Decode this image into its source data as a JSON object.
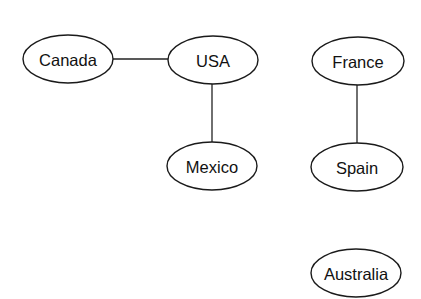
{
  "diagram": {
    "type": "undirected-graph",
    "style": {
      "stroke_color": "#1a1a1a",
      "text_color": "#111111",
      "background": "#ffffff"
    },
    "nodes": [
      {
        "id": "canada",
        "label": "Canada",
        "cx": 68,
        "cy": 59,
        "rx": 45,
        "ry": 24
      },
      {
        "id": "usa",
        "label": "USA",
        "cx": 213,
        "cy": 60,
        "rx": 45,
        "ry": 24
      },
      {
        "id": "france",
        "label": "France",
        "cx": 358,
        "cy": 61,
        "rx": 46,
        "ry": 24
      },
      {
        "id": "mexico",
        "label": "Mexico",
        "cx": 212,
        "cy": 166,
        "rx": 45,
        "ry": 24
      },
      {
        "id": "spain",
        "label": "Spain",
        "cx": 357,
        "cy": 167,
        "rx": 46,
        "ry": 24
      },
      {
        "id": "australia",
        "label": "Australia",
        "cx": 356,
        "cy": 273,
        "rx": 45,
        "ry": 24
      }
    ],
    "edges": [
      {
        "from": "canada",
        "to": "usa",
        "x1": 113,
        "y1": 59,
        "x2": 168,
        "y2": 59
      },
      {
        "from": "usa",
        "to": "mexico",
        "x1": 212,
        "y1": 84,
        "x2": 212,
        "y2": 142
      },
      {
        "from": "france",
        "to": "spain",
        "x1": 357,
        "y1": 85,
        "x2": 357,
        "y2": 143
      }
    ]
  }
}
